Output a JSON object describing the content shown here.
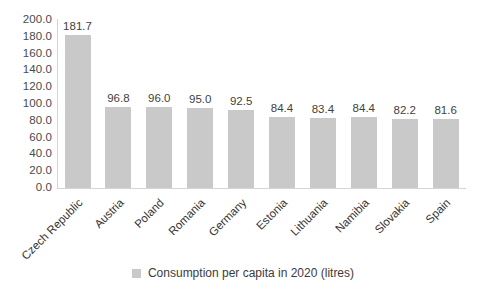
{
  "chart_data": {
    "type": "bar",
    "title": "",
    "subtitle": "",
    "xlabel": "",
    "ylabel": "",
    "categories": [
      "Czech Republic",
      "Austria",
      "Poland",
      "Romania",
      "Germany",
      "Estonia",
      "Lithuania",
      "Namibia",
      "Slovakia",
      "Spain"
    ],
    "values": [
      181.7,
      96.8,
      96.0,
      95.0,
      92.5,
      84.4,
      83.4,
      84.4,
      82.2,
      81.6
    ],
    "data_labels": [
      "181.7",
      "96.8",
      "96.0",
      "95.0",
      "92.5",
      "84.4",
      "83.4",
      "84.4",
      "82.2",
      "81.6"
    ],
    "series": [
      {
        "name": "Consumption per capita in 2020 (litres)",
        "values": [
          181.7,
          96.8,
          96.0,
          95.0,
          92.5,
          84.4,
          83.4,
          84.4,
          82.2,
          81.6
        ],
        "color": "#c9c9c9"
      }
    ],
    "ylim": [
      0,
      200
    ],
    "ytick_step": 20,
    "ytick_labels": [
      "200.0",
      "180.0",
      "160.0",
      "140.0",
      "120.0",
      "100.0",
      "80.0",
      "60.0",
      "40.0",
      "20.0",
      "0.0"
    ],
    "ytick_values": [
      200,
      180,
      160,
      140,
      120,
      100,
      80,
      60,
      40,
      20,
      0
    ],
    "grid": false,
    "legend_position": "bottom",
    "xtick_rotation": -45
  },
  "legend": {
    "entries": [
      {
        "label": "Consumption per capita in 2020 (litres)",
        "color": "#c9c9c9",
        "marker": "square-swatch"
      }
    ]
  },
  "colors": {
    "bar": "#c9c9c9",
    "axis": "#d4d4d4",
    "text": "#3f3f3f",
    "background": "#ffffff"
  }
}
